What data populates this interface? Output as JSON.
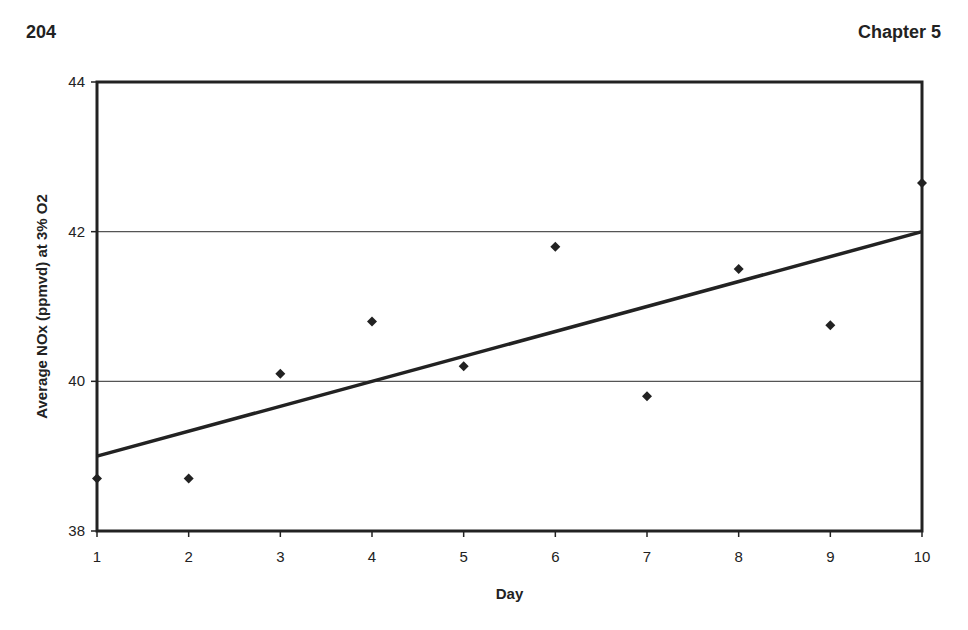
{
  "page": {
    "page_number": "204",
    "chapter": "Chapter 5"
  },
  "chart_data": {
    "type": "scatter",
    "title": "",
    "xlabel": "Day",
    "ylabel": "Average NOx (ppmvd) at 3% O2",
    "x": [
      1,
      2,
      3,
      4,
      5,
      6,
      7,
      8,
      9,
      10
    ],
    "series": [
      {
        "name": "Average NOx",
        "marker": "diamond",
        "values": [
          38.7,
          38.7,
          40.1,
          40.8,
          40.2,
          41.8,
          39.8,
          41.5,
          40.75,
          42.65
        ]
      },
      {
        "name": "Linear trend",
        "type": "line",
        "x": [
          1,
          10
        ],
        "values": [
          39.0,
          42.0
        ]
      }
    ],
    "xticks": [
      "1",
      "2",
      "3",
      "4",
      "5",
      "6",
      "7",
      "8",
      "9",
      "10"
    ],
    "yticks": [
      "38",
      "40",
      "42",
      "44"
    ],
    "xlim": [
      1,
      10
    ],
    "ylim": [
      38,
      44
    ],
    "grid": "horizontal at 40 and 42",
    "legend": "none"
  }
}
